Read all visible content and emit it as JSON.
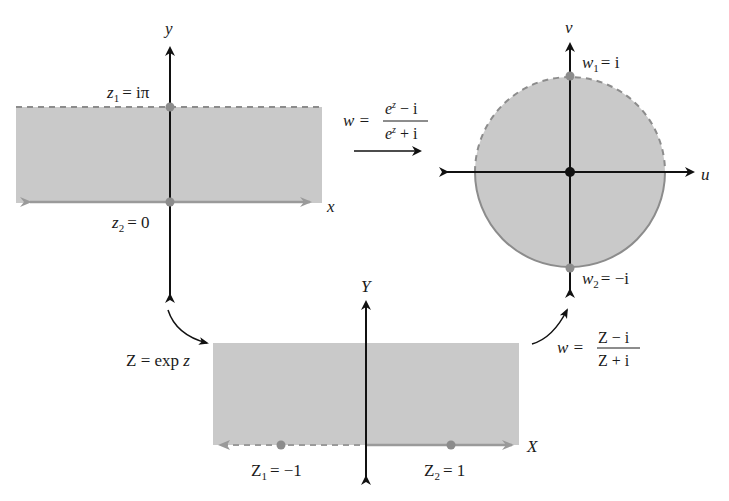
{
  "colors": {
    "region_fill": "#c9c9c9",
    "boundary": "#8c8c8c",
    "axis": "#111111",
    "point": "#8c8c8c",
    "origin_point": "#111111"
  },
  "z_plane": {
    "x_axis_label": "x",
    "y_axis_label": "y",
    "z1": {
      "name": "z",
      "sub": "1",
      "value": "= iπ"
    },
    "z2": {
      "name": "z",
      "sub": "2",
      "value": "= 0"
    }
  },
  "w_plane": {
    "u_axis_label": "u",
    "v_axis_label": "v",
    "w1": {
      "name": "w",
      "sub": "1",
      "value": "= i"
    },
    "w2": {
      "name": "w",
      "sub": "2",
      "value": "= −i"
    }
  },
  "Z_plane": {
    "X_axis_label": "X",
    "Y_axis_label": "Y",
    "Z1": {
      "name": "Z",
      "sub": "1",
      "value": "= −1"
    },
    "Z2": {
      "name": "Z",
      "sub": "2",
      "value": "= 1"
    }
  },
  "mappings": {
    "direct": {
      "lhs": "w =",
      "numerator": "e^z − i",
      "num_base": "e",
      "num_exp": "z",
      "num_rest": " − i",
      "den_base": "e",
      "den_exp": "z",
      "den_rest": " + i"
    },
    "exp": {
      "text_prefix": "Z = exp ",
      "text_var": "z"
    },
    "mobius": {
      "lhs": "w =",
      "numerator": "Z − i",
      "denominator": "Z + i"
    }
  }
}
